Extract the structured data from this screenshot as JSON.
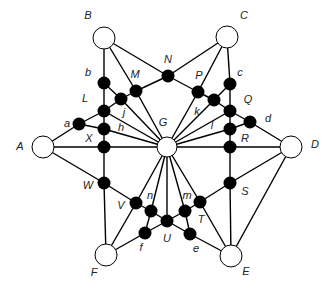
{
  "diagram": {
    "type": "graph",
    "hubs": [
      {
        "id": "A",
        "x": 43,
        "y": 147,
        "r": 11,
        "label": "A",
        "lx": 20,
        "ly": 147
      },
      {
        "id": "B",
        "x": 104,
        "y": 38,
        "r": 11,
        "label": "B",
        "lx": 88,
        "ly": 16
      },
      {
        "id": "C",
        "x": 227,
        "y": 37,
        "r": 11,
        "label": "C",
        "lx": 244,
        "ly": 16
      },
      {
        "id": "D",
        "x": 291,
        "y": 147,
        "r": 11,
        "label": "D",
        "lx": 315,
        "ly": 145
      },
      {
        "id": "E",
        "x": 231,
        "y": 256,
        "r": 11,
        "label": "E",
        "lx": 246,
        "ly": 272
      },
      {
        "id": "F",
        "x": 106,
        "y": 255,
        "r": 11,
        "label": "F",
        "lx": 94,
        "ly": 273
      },
      {
        "id": "G",
        "x": 167,
        "y": 147,
        "r": 10,
        "label": "G",
        "lx": 163,
        "ly": 123
      }
    ],
    "nodes": [
      {
        "id": "N",
        "x": 168,
        "y": 76,
        "label": "N",
        "lx": 168,
        "ly": 60
      },
      {
        "id": "M",
        "x": 136,
        "y": 91,
        "label": "M",
        "lx": 135,
        "ly": 75
      },
      {
        "id": "P",
        "x": 198,
        "y": 92,
        "label": "P",
        "lx": 199,
        "ly": 76
      },
      {
        "id": "b",
        "x": 104,
        "y": 83,
        "label": "b",
        "lx": 88,
        "ly": 73
      },
      {
        "id": "j",
        "x": 121,
        "y": 99,
        "label": "j",
        "lx": 124,
        "ly": 113
      },
      {
        "id": "L",
        "x": 104,
        "y": 111,
        "label": "L",
        "lx": 85,
        "ly": 99
      },
      {
        "id": "a",
        "x": 79,
        "y": 124,
        "label": "a",
        "lx": 67,
        "ly": 124
      },
      {
        "id": "h",
        "x": 104,
        "y": 129,
        "label": "h",
        "lx": 121,
        "ly": 128
      },
      {
        "id": "X",
        "x": 104,
        "y": 147,
        "label": "X",
        "lx": 89,
        "ly": 139
      },
      {
        "id": "W",
        "x": 104,
        "y": 183,
        "label": "W",
        "lx": 88,
        "ly": 186
      },
      {
        "id": "c",
        "x": 230,
        "y": 84,
        "label": "c",
        "lx": 240,
        "ly": 73
      },
      {
        "id": "k",
        "x": 214,
        "y": 100,
        "label": "k",
        "lx": 197,
        "ly": 112
      },
      {
        "id": "Q",
        "x": 230,
        "y": 111,
        "label": "Q",
        "lx": 248,
        "ly": 100
      },
      {
        "id": "d",
        "x": 250,
        "y": 122,
        "label": "d",
        "lx": 268,
        "ly": 119
      },
      {
        "id": "l",
        "x": 230,
        "y": 129,
        "label": "l",
        "lx": 212,
        "ly": 126
      },
      {
        "id": "R",
        "x": 230,
        "y": 147,
        "label": "R",
        "lx": 245,
        "ly": 139
      },
      {
        "id": "S",
        "x": 230,
        "y": 183,
        "label": "S",
        "lx": 245,
        "ly": 192
      },
      {
        "id": "V",
        "x": 136,
        "y": 203,
        "label": "V",
        "lx": 121,
        "ly": 206
      },
      {
        "id": "n",
        "x": 151,
        "y": 211,
        "label": "n",
        "lx": 150,
        "ly": 196
      },
      {
        "id": "U",
        "x": 167,
        "y": 221,
        "label": "U",
        "lx": 167,
        "ly": 239
      },
      {
        "id": "f",
        "x": 145,
        "y": 233,
        "label": "f",
        "lx": 141,
        "ly": 248
      },
      {
        "id": "m",
        "x": 185,
        "y": 211,
        "label": "m",
        "lx": 187,
        "ly": 196
      },
      {
        "id": "T",
        "x": 200,
        "y": 202,
        "label": "T",
        "lx": 201,
        "ly": 220
      },
      {
        "id": "e",
        "x": 190,
        "y": 234,
        "label": "e",
        "lx": 196,
        "ly": 249
      }
    ],
    "edges": [
      [
        "B",
        "b"
      ],
      [
        "B",
        "M"
      ],
      [
        "B",
        "N"
      ],
      [
        "C",
        "N"
      ],
      [
        "C",
        "P"
      ],
      [
        "C",
        "c"
      ],
      [
        "N",
        "M"
      ],
      [
        "N",
        "P"
      ],
      [
        "b",
        "L"
      ],
      [
        "b",
        "j"
      ],
      [
        "j",
        "M"
      ],
      [
        "L",
        "j"
      ],
      [
        "L",
        "h"
      ],
      [
        "h",
        "X"
      ],
      [
        "X",
        "W"
      ],
      [
        "W",
        "F"
      ],
      [
        "c",
        "Q"
      ],
      [
        "c",
        "k"
      ],
      [
        "k",
        "P"
      ],
      [
        "Q",
        "k"
      ],
      [
        "Q",
        "l"
      ],
      [
        "l",
        "R"
      ],
      [
        "R",
        "S"
      ],
      [
        "S",
        "E"
      ],
      [
        "A",
        "a"
      ],
      [
        "a",
        "L"
      ],
      [
        "a",
        "h"
      ],
      [
        "A",
        "X"
      ],
      [
        "X",
        "G"
      ],
      [
        "A",
        "W"
      ],
      [
        "W",
        "V"
      ],
      [
        "d",
        "D"
      ],
      [
        "Q",
        "d"
      ],
      [
        "l",
        "d"
      ],
      [
        "R",
        "G"
      ],
      [
        "R",
        "D"
      ],
      [
        "D",
        "S"
      ],
      [
        "S",
        "T"
      ],
      [
        "D",
        "E"
      ],
      [
        "V",
        "F"
      ],
      [
        "V",
        "n"
      ],
      [
        "n",
        "U"
      ],
      [
        "U",
        "m"
      ],
      [
        "m",
        "T"
      ],
      [
        "n",
        "f"
      ],
      [
        "f",
        "F"
      ],
      [
        "f",
        "U"
      ],
      [
        "U",
        "e"
      ],
      [
        "m",
        "e"
      ],
      [
        "e",
        "E"
      ],
      [
        "T",
        "E"
      ],
      [
        "G",
        "M"
      ],
      [
        "G",
        "j"
      ],
      [
        "G",
        "L"
      ],
      [
        "G",
        "h"
      ],
      [
        "G",
        "P"
      ],
      [
        "G",
        "k"
      ],
      [
        "G",
        "Q"
      ],
      [
        "G",
        "l"
      ],
      [
        "G",
        "V"
      ],
      [
        "G",
        "n"
      ],
      [
        "G",
        "U"
      ],
      [
        "G",
        "m"
      ],
      [
        "G",
        "T"
      ]
    ]
  }
}
